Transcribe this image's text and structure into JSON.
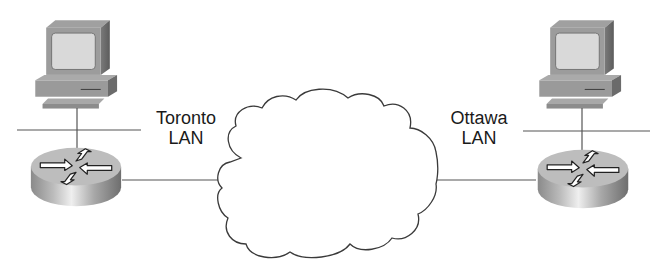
{
  "diagram": {
    "type": "network-topology",
    "background": "#ffffff",
    "line_color": "#555555",
    "nodes": [
      {
        "id": "toronto-pc",
        "kind": "workstation"
      },
      {
        "id": "toronto-router",
        "kind": "router"
      },
      {
        "id": "wan-cloud",
        "kind": "cloud"
      },
      {
        "id": "ottawa-router",
        "kind": "router"
      },
      {
        "id": "ottawa-pc",
        "kind": "workstation"
      }
    ],
    "links": [
      {
        "from": "toronto-pc",
        "to": "toronto-router",
        "via": "toronto-lan-segment"
      },
      {
        "from": "toronto-router",
        "to": "wan-cloud"
      },
      {
        "from": "wan-cloud",
        "to": "ottawa-router"
      },
      {
        "from": "ottawa-pc",
        "to": "ottawa-router",
        "via": "ottawa-lan-segment"
      }
    ]
  },
  "labels": {
    "toronto": {
      "line1": "Toronto",
      "line2": "LAN"
    },
    "ottawa": {
      "line1": "Ottawa",
      "line2": "LAN"
    }
  },
  "colors": {
    "device_top": "#b5b5b5",
    "device_side": "#8a8a8a",
    "device_dark": "#6a6a6a",
    "screen": "#d8d8d8",
    "router_top": "#bdbdbd",
    "router_side_light": "#e6e6e6",
    "router_side_dark": "#7c7c7c",
    "cloud_stroke": "#3a3a3a",
    "text": "#1a1a1a"
  }
}
